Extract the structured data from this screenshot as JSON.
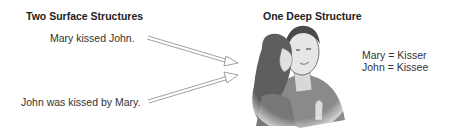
{
  "left": {
    "heading": "Two Surface Structures",
    "sentence_active": "Mary kissed John.",
    "sentence_passive": "John was kissed by Mary."
  },
  "right": {
    "heading": "One Deep Structure",
    "roles": [
      "Mary = Kisser",
      "John = Kissee"
    ]
  },
  "illustration": "woman-kissing-man-cheek"
}
